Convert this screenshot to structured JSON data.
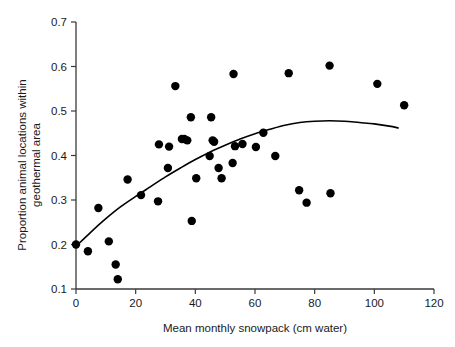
{
  "chart_data": {
    "type": "scatter",
    "title": "",
    "subtitle": "",
    "xlabel": "Mean monthly snowpack (cm water)",
    "ylabel": "Proportion animal locations within geothermal area",
    "ylabel_line1": "Proportion animal locations within",
    "ylabel_line2": "geothermal area",
    "xlim": [
      0,
      120
    ],
    "ylim": [
      0.1,
      0.7
    ],
    "xticks": [
      0,
      20,
      40,
      60,
      80,
      100,
      120
    ],
    "xtick_labels": [
      "0",
      "20",
      "40",
      "60",
      "80",
      "100",
      "120"
    ],
    "yticks": [
      0.1,
      0.2,
      0.3,
      0.4,
      0.5,
      0.6,
      0.7
    ],
    "ytick_labels": [
      "0.1",
      "0.2",
      "0.3",
      "0.4",
      "0.5",
      "0.6",
      "0.7"
    ],
    "grid": false,
    "legend": null,
    "legend_position": "none",
    "point_color": "#000000",
    "curve_color": "#000000",
    "axis_color": "#3a3a3a",
    "marker_size_px": 5.2,
    "points": [
      {
        "x": 0.0,
        "y": 0.2
      },
      {
        "x": 4.0,
        "y": 0.185
      },
      {
        "x": 7.5,
        "y": 0.282
      },
      {
        "x": 11.0,
        "y": 0.207
      },
      {
        "x": 13.3,
        "y": 0.155
      },
      {
        "x": 14.0,
        "y": 0.122
      },
      {
        "x": 17.3,
        "y": 0.346
      },
      {
        "x": 21.8,
        "y": 0.311
      },
      {
        "x": 27.5,
        "y": 0.297
      },
      {
        "x": 27.8,
        "y": 0.425
      },
      {
        "x": 30.8,
        "y": 0.372
      },
      {
        "x": 31.2,
        "y": 0.42
      },
      {
        "x": 33.3,
        "y": 0.556
      },
      {
        "x": 35.5,
        "y": 0.437
      },
      {
        "x": 36.3,
        "y": 0.437
      },
      {
        "x": 37.3,
        "y": 0.434
      },
      {
        "x": 38.5,
        "y": 0.486
      },
      {
        "x": 38.8,
        "y": 0.253
      },
      {
        "x": 40.3,
        "y": 0.349
      },
      {
        "x": 44.8,
        "y": 0.399
      },
      {
        "x": 45.3,
        "y": 0.486
      },
      {
        "x": 45.8,
        "y": 0.434
      },
      {
        "x": 46.3,
        "y": 0.431
      },
      {
        "x": 47.8,
        "y": 0.372
      },
      {
        "x": 48.8,
        "y": 0.349
      },
      {
        "x": 52.5,
        "y": 0.383
      },
      {
        "x": 52.8,
        "y": 0.583
      },
      {
        "x": 53.3,
        "y": 0.421
      },
      {
        "x": 55.8,
        "y": 0.426
      },
      {
        "x": 60.3,
        "y": 0.419
      },
      {
        "x": 62.8,
        "y": 0.451
      },
      {
        "x": 66.8,
        "y": 0.399
      },
      {
        "x": 71.3,
        "y": 0.585
      },
      {
        "x": 74.8,
        "y": 0.322
      },
      {
        "x": 77.3,
        "y": 0.294
      },
      {
        "x": 85.0,
        "y": 0.602
      },
      {
        "x": 85.3,
        "y": 0.315
      },
      {
        "x": 101.0,
        "y": 0.561
      },
      {
        "x": 110.0,
        "y": 0.513
      }
    ],
    "fit_curve": {
      "name": "fitted polynomial trend",
      "x": [
        0,
        5,
        10,
        15,
        20,
        25,
        30,
        35,
        40,
        45,
        50,
        55,
        60,
        65,
        70,
        75,
        80,
        85,
        90,
        95,
        100,
        105,
        108
      ],
      "y": [
        0.196,
        0.228,
        0.258,
        0.285,
        0.308,
        0.33,
        0.352,
        0.372,
        0.391,
        0.408,
        0.423,
        0.437,
        0.449,
        0.459,
        0.468,
        0.474,
        0.477,
        0.478,
        0.477,
        0.474,
        0.471,
        0.466,
        0.462
      ]
    }
  }
}
